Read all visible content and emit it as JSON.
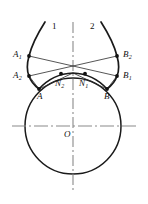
{
  "figure": {
    "background_color": "#ffffff",
    "stroke_color": "#1a1a1a",
    "axis_color": "#8a8a8a",
    "thin_line_color": "#2b2b2b",
    "width": 148,
    "height": 204
  },
  "geometry": {
    "circle": {
      "cx": 73,
      "cy": 126,
      "r": 48
    },
    "vertical_axis": {
      "x": 73,
      "y_top": 22,
      "y_bottom": 190
    },
    "horizontal_axis": {
      "y": 126,
      "x_left": 12,
      "x_right": 136
    },
    "crossing_point": {
      "x": 73,
      "y": 75
    },
    "points": {
      "A": {
        "x": 39,
        "y": 89
      },
      "A1": {
        "x": 29,
        "y": 56
      },
      "A2": {
        "x": 29,
        "y": 76
      },
      "B": {
        "x": 107,
        "y": 89
      },
      "B1": {
        "x": 117,
        "y": 76
      },
      "B2": {
        "x": 117,
        "y": 56
      },
      "N1": {
        "x": 85,
        "y": 73
      },
      "N2": {
        "x": 61,
        "y": 73
      },
      "O": {
        "x": 73,
        "y": 126
      }
    }
  },
  "labels": {
    "curve_1": "1",
    "curve_2": "2",
    "point_A": "A",
    "point_A1_base": "A",
    "point_A1_sub": "1",
    "point_A2_base": "A",
    "point_A2_sub": "2",
    "point_B": "B",
    "point_B1_base": "B",
    "point_B1_sub": "1",
    "point_B2_base": "B",
    "point_B2_sub": "2",
    "point_N1_base": "N",
    "point_N1_sub": "1",
    "point_N2_base": "N",
    "point_N2_sub": "2",
    "center_O": "O"
  }
}
